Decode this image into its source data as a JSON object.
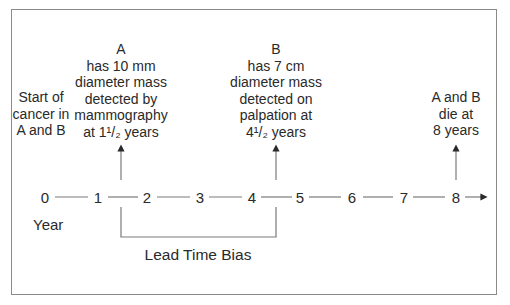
{
  "diagram": {
    "title": "Lead Time Bias",
    "annotations": {
      "start": [
        "Start of",
        "cancer in",
        "A and B"
      ],
      "a": [
        "A",
        "has 10 mm",
        "diameter mass",
        "detected by",
        "mammography",
        "at 1¹/₂ years"
      ],
      "b": [
        "B",
        "has 7 cm",
        "diameter mass",
        "detected on",
        "palpation at",
        "4¹/₂ years"
      ],
      "death": [
        "A and B",
        "die at",
        "8 years"
      ]
    },
    "axis": {
      "label": "Year",
      "ticks": [
        "0",
        "1",
        "2",
        "3",
        "4",
        "5",
        "6",
        "7",
        "8"
      ]
    },
    "bracket_label": "Lead Time Bias",
    "colors": {
      "line": "#7a7a7a",
      "text": "#2a2a2a",
      "frame": "#8a8a8a"
    }
  }
}
